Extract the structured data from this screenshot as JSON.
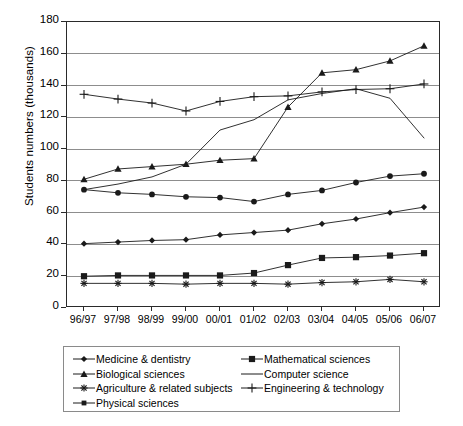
{
  "chart_data": {
    "type": "line",
    "title": "",
    "subtitle": "",
    "xlabel": "",
    "ylabel": "Students numbers (thousands)",
    "categories": [
      "96/97",
      "97/98",
      "98/99",
      "99/00",
      "00/01",
      "01/02",
      "02/03",
      "03/04",
      "04/05",
      "05/06",
      "06/07"
    ],
    "ylim": [
      0,
      180
    ],
    "ytick_step": 20,
    "yticks": [
      "0",
      "20",
      "40",
      "60",
      "80",
      "100",
      "120",
      "140",
      "160",
      "180"
    ],
    "grid": "horizontal",
    "legend_position": "below-chart",
    "series": [
      {
        "name": "Medicine & dentistry",
        "marker": "diamond",
        "values": [
          40.5,
          41.5,
          42.5,
          43,
          46,
          47.5,
          49,
          53,
          56,
          60,
          63.5
        ]
      },
      {
        "name": "Biological sciences",
        "marker": "triangle",
        "values": [
          81,
          87.5,
          89,
          90.5,
          93,
          94,
          126.5,
          148,
          150,
          155.5,
          165
        ]
      },
      {
        "name": "Agriculture & related subjects",
        "marker": "asterisk",
        "values": [
          15.5,
          15.5,
          15.5,
          15,
          15.5,
          15.5,
          15,
          16,
          16.5,
          18,
          16.5
        ]
      },
      {
        "name": "Physical sciences",
        "marker": "circle",
        "values": [
          74.5,
          72.5,
          71.5,
          70,
          69.5,
          67,
          71.5,
          74,
          79,
          83,
          84.5
        ]
      },
      {
        "name": "Mathematical sciences",
        "marker": "square",
        "values": [
          20,
          20.5,
          20.5,
          20.5,
          20.5,
          22,
          27,
          31.5,
          32,
          33,
          34.5
        ]
      },
      {
        "name": "Computer science",
        "marker": "none",
        "values": [
          74.5,
          78,
          82.5,
          90.5,
          112,
          118.5,
          131,
          135,
          138,
          132,
          107
        ]
      },
      {
        "name": "Engineering & technology",
        "marker": "plus",
        "values": [
          134.5,
          131.5,
          129,
          124,
          130,
          133,
          133.5,
          136,
          137.5,
          138,
          141
        ]
      }
    ]
  },
  "legend": {
    "left_column": [
      {
        "label": "Medicine & dentistry",
        "marker": "diamond"
      },
      {
        "label": "Biological sciences",
        "marker": "triangle"
      },
      {
        "label": "Agriculture & related subjects",
        "marker": "asterisk"
      },
      {
        "label": "Physical sciences",
        "marker": "square-small"
      }
    ],
    "right_column": [
      {
        "label": "Mathematical sciences",
        "marker": "square"
      },
      {
        "label": "Computer science",
        "marker": "none"
      },
      {
        "label": "Engineering & technology",
        "marker": "plus"
      }
    ]
  },
  "colors": {
    "line": "#1a1a1a",
    "grid": "#8d8d8d",
    "axis": "#2a2a2a",
    "background": "#ffffff",
    "legend_border": "#8a8a8a"
  }
}
